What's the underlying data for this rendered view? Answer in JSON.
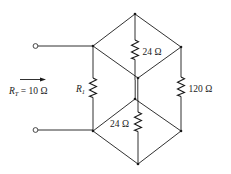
{
  "diagram": {
    "type": "circuit-schematic",
    "input": {
      "arrow_label_main": "R",
      "arrow_label_sub": "T",
      "arrow_label_value": " = 10 Ω"
    },
    "resistors": [
      {
        "id": "R1",
        "label_main": "R",
        "label_sub": "1",
        "position": "left vertical"
      },
      {
        "id": "R_top",
        "label": "24 Ω",
        "position": "top center vertical"
      },
      {
        "id": "R_bottom",
        "label": "24 Ω",
        "position": "bottom center vertical"
      },
      {
        "id": "R_right",
        "label": "120 Ω",
        "position": "right vertical"
      }
    ],
    "colors": {
      "line": "#1a1a1a",
      "background": "#ffffff"
    }
  }
}
